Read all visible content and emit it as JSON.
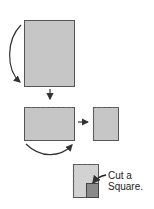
{
  "diagram": {
    "colors": {
      "paper_fill": "#c6c6c6",
      "paper_stroke": "#555555",
      "cut_fill": "#8a8a8a",
      "arrow": "#333333"
    },
    "steps": [
      {
        "id": "step-1",
        "label": "Full sheet",
        "fold": "fold top-left edge down (curved arrow)"
      },
      {
        "id": "step-2",
        "label": "Folded in half",
        "fold": "fold left to right (curved arrow)"
      },
      {
        "id": "step-3",
        "label": "Folded in quarters"
      },
      {
        "id": "step-4",
        "label": "Cut a square from corner"
      }
    ],
    "caption": {
      "line1": "Cut a",
      "line2": "Square."
    }
  }
}
